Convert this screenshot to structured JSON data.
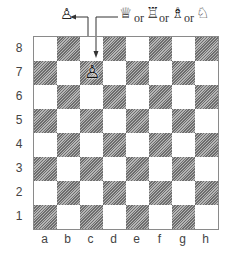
{
  "diagram": {
    "ranks": [
      "8",
      "7",
      "6",
      "5",
      "4",
      "3",
      "2",
      "1"
    ],
    "files": [
      "a",
      "b",
      "c",
      "d",
      "e",
      "f",
      "g",
      "h"
    ],
    "pawn_on_board": {
      "square": "c7",
      "glyph": "♙",
      "name": "white-pawn"
    },
    "pawn_above": {
      "glyph": "♙",
      "name": "white-pawn"
    },
    "promotion_options": [
      {
        "glyph": "♕",
        "name": "queen"
      },
      {
        "glyph": "♖",
        "name": "rook"
      },
      {
        "glyph": "♗",
        "name": "bishop"
      },
      {
        "glyph": "♘",
        "name": "knight"
      }
    ],
    "or_label": "or",
    "colors": {
      "dark_square": "#8c8c8c",
      "light_square": "#ffffff",
      "border": "#8a8a8a",
      "ink": "#333333"
    }
  }
}
